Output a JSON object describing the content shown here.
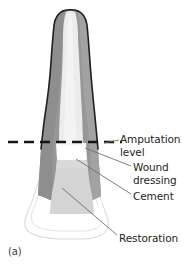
{
  "figure": {
    "panel_label": "(a)",
    "caption_title": "Amputated tooth root restored with wound dressing, cement and restoration",
    "labels": {
      "amputation_level": "Amputation\nlevel",
      "wound_dressing": "Wound\ndressing",
      "cement": "Cement",
      "restoration": "Restoration"
    },
    "colors": {
      "background": "#ffffff",
      "dentin_dark_gray": "#969696",
      "dentin_mid_gray": "#a8a8a8",
      "pulp_light": "#ededed",
      "enamel_outline": "#1a1a1a",
      "cement_block": "#d4d4d4",
      "wound_dressing_white": "#ffffff",
      "restoration_outline": "#d8d8d8",
      "leader_line": "#6e6e6e",
      "amputation_dash": "#111111",
      "text": "#231f20"
    },
    "elements": {
      "tooth_root": "tooth-root-shape",
      "pulp_canal": "pulp-canal",
      "amputation_dashed_line": "amputation-dashed-line",
      "wound_dressing_band": "wound-dressing-band",
      "cement_block": "cement-block",
      "restoration_outline": "restoration-outline"
    },
    "leader_lines": [
      {
        "name": "leader-amputation",
        "from": [
          120,
          140
        ],
        "to": [
          103,
          143
        ]
      },
      {
        "name": "leader-wound-dressing",
        "from": [
          131,
          166
        ],
        "to": [
          84,
          148
        ]
      },
      {
        "name": "leader-cement",
        "from": [
          131,
          194
        ],
        "to": [
          76,
          159
        ]
      },
      {
        "name": "leader-restoration",
        "from": [
          118,
          235
        ],
        "to": [
          63,
          189
        ]
      }
    ]
  }
}
